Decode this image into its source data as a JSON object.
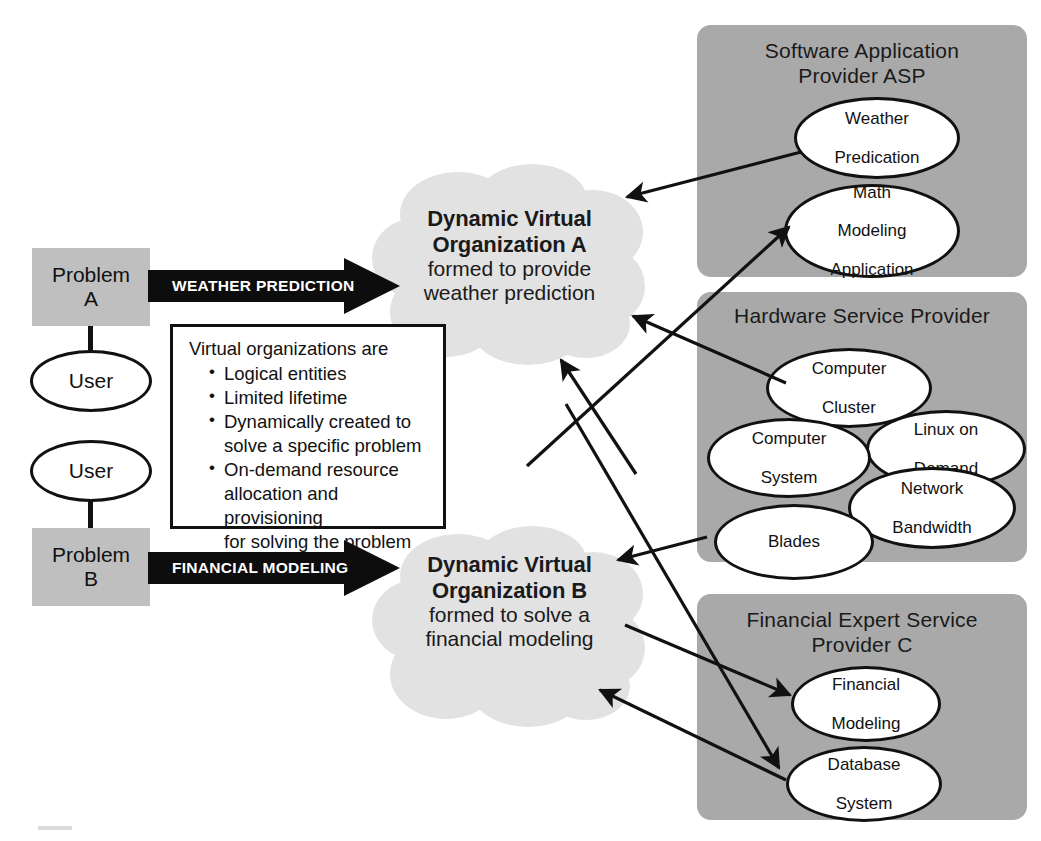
{
  "problems": [
    {
      "id": "problem-a",
      "label": "Problem\nA",
      "line1": "Problem",
      "line2": "A"
    },
    {
      "id": "problem-b",
      "label": "Problem\nB",
      "line1": "Problem",
      "line2": "B"
    }
  ],
  "users": [
    {
      "id": "user-top",
      "label": "User"
    },
    {
      "id": "user-bottom",
      "label": "User"
    }
  ],
  "flow_arrows": [
    {
      "id": "weather-prediction-arrow",
      "label": "WEATHER PREDICTION"
    },
    {
      "id": "financial-modeling-arrow",
      "label": "FINANCIAL MODELING"
    }
  ],
  "clouds": [
    {
      "id": "cloud-a",
      "title_line1": "Dynamic Virtual",
      "title_line2": "Organization A",
      "subtitle_line1": "formed to provide",
      "subtitle_line2": "weather prediction"
    },
    {
      "id": "cloud-b",
      "title_line1": "Dynamic Virtual",
      "title_line2": "Organization B",
      "subtitle_line1": "formed to solve a",
      "subtitle_line2": "financial modeling"
    }
  ],
  "info_box": {
    "lead": "Virtual organizations are",
    "bullets": [
      "Logical entities",
      "Limited lifetime",
      "Dynamically created to solve a specific problem",
      "On-demand resource allocation and provisioning for solving the problem"
    ],
    "bullet_lines": [
      [
        "Logical entities"
      ],
      [
        "Limited lifetime"
      ],
      [
        "Dynamically created to",
        "solve a specific problem"
      ],
      [
        "On-demand resource",
        "allocation and provisioning",
        "for solving the problem"
      ]
    ]
  },
  "providers": [
    {
      "id": "software-application-provider",
      "title_line1": "Software Application",
      "title_line2": "Provider ASP",
      "services": [
        {
          "id": "weather-predication",
          "line1": "Weather",
          "line2": "Predication",
          "line3": ""
        },
        {
          "id": "math-modeling-application",
          "line1": "Math",
          "line2": "Modeling",
          "line3": "Application"
        }
      ]
    },
    {
      "id": "hardware-service-provider",
      "title_line1": "Hardware Service Provider",
      "title_line2": "",
      "services": [
        {
          "id": "computer-cluster",
          "line1": "Computer",
          "line2": "Cluster",
          "line3": ""
        },
        {
          "id": "computer-system",
          "line1": "Computer",
          "line2": "System",
          "line3": ""
        },
        {
          "id": "linux-on-demand",
          "line1": "Linux on",
          "line2": "Demand",
          "line3": ""
        },
        {
          "id": "blades",
          "line1": "Blades",
          "line2": "",
          "line3": ""
        },
        {
          "id": "network-bandwidth",
          "line1": "Network",
          "line2": "Bandwidth",
          "line3": ""
        }
      ]
    },
    {
      "id": "financial-expert-service-provider",
      "title_line1": "Financial Expert Service",
      "title_line2": "Provider C",
      "services": [
        {
          "id": "financial-modeling",
          "line1": "Financial",
          "line2": "Modeling",
          "line3": ""
        },
        {
          "id": "database-system",
          "line1": "Database",
          "line2": "System",
          "line3": ""
        }
      ]
    }
  ],
  "connections": [
    {
      "id": "weather-predication-to-cloud-a",
      "from": "weather-predication",
      "to": "cloud-a"
    },
    {
      "id": "computer-cluster-to-cloud-a",
      "from": "computer-cluster",
      "to": "cloud-a"
    },
    {
      "id": "cloud-b-to-cloud-a-region",
      "from": "database-system",
      "to": "cloud-a"
    },
    {
      "id": "cloud-b-to-math-modeling",
      "from": "cloud-b",
      "to": "math-modeling-application"
    },
    {
      "id": "blades-to-cloud-b",
      "from": "blades",
      "to": "cloud-b"
    },
    {
      "id": "cloud-b-to-financial-modeling",
      "from": "cloud-b",
      "to": "financial-modeling"
    },
    {
      "id": "cloud-b-to-database-system",
      "from": "cloud-b",
      "to": "database-system"
    },
    {
      "id": "database-system-to-cloud-b",
      "from": "database-system",
      "to": "cloud-b"
    }
  ],
  "colors": {
    "provider_panel": "#a9a9a9",
    "cloud_fill": "#e2e2e2",
    "problem_box": "#bfbfbf",
    "node_fill": "#ffffff",
    "stroke": "#111111",
    "block_arrow": "#0d0d0d",
    "block_arrow_text": "#ffffff",
    "page_background": "#ffffff"
  }
}
